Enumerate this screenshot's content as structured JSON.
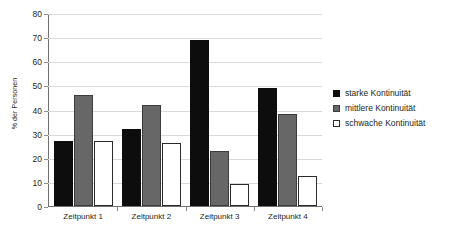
{
  "chart_data": {
    "type": "bar",
    "title": "",
    "xlabel": "",
    "ylabel": "% der Personen",
    "ylim": [
      0,
      80
    ],
    "yticks": [
      0,
      10,
      20,
      30,
      40,
      50,
      60,
      70,
      80
    ],
    "ytick_labels": [
      "0",
      "10",
      "20",
      "30",
      "40",
      "50",
      "60",
      "70",
      "80"
    ],
    "grid": true,
    "legend_position": "right",
    "categories": [
      "Zeitpunkt 1",
      "Zeitpunkt 2",
      "Zeitpunkt 3",
      "Zeitpunkt 4"
    ],
    "series": [
      {
        "name": "starke Kontinuität",
        "color": "#0d0d0d",
        "values": [
          27,
          32,
          69,
          49
        ]
      },
      {
        "name": "mittlere Kontinuität",
        "color": "#676767",
        "values": [
          46,
          42,
          23,
          38
        ]
      },
      {
        "name": "schwache Kontinuität",
        "color": "#ffffff",
        "values": [
          27,
          26,
          9,
          12.5
        ]
      }
    ]
  },
  "colors": {
    "strong": "#0d0d0d",
    "middle": "#676767",
    "weak": "#ffffff",
    "grid": "#d9dadb",
    "axis": "#6f7072",
    "text": "#231f20"
  }
}
